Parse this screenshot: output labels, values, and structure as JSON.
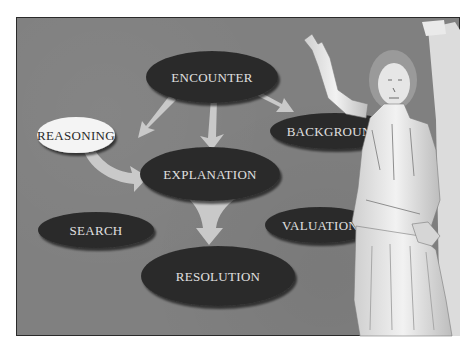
{
  "slide": {
    "background_color": "#808080",
    "frame_border_color": "#2a2a2a"
  },
  "nodes": {
    "encounter": {
      "label": "ENCOUNTER",
      "fill": "#2b2b2b",
      "text_color": "#e0e0e0"
    },
    "reasoning": {
      "label": "REASONING",
      "fill": "#f4f4f4",
      "text_color": "#2a2a2a"
    },
    "background": {
      "label": "BACKGROUND",
      "fill": "#2b2b2b",
      "text_color": "#e0e0e0"
    },
    "explanation": {
      "label": "EXPLANATION",
      "fill": "#2b2b2b",
      "text_color": "#e0e0e0"
    },
    "search": {
      "label": "SEARCH",
      "fill": "#2b2b2b",
      "text_color": "#e0e0e0"
    },
    "valuation": {
      "label": "VALUATION",
      "fill": "#2b2b2b",
      "text_color": "#e0e0e0"
    },
    "resolution": {
      "label": "RESOLUTION",
      "fill": "#2b2b2b",
      "text_color": "#e0e0e0"
    }
  },
  "edges": [
    {
      "from": "ENCOUNTER",
      "to": "REASONING"
    },
    {
      "from": "ENCOUNTER",
      "to": "EXPLANATION"
    },
    {
      "from": "ENCOUNTER",
      "to": "BACKGROUND"
    },
    {
      "from": "REASONING",
      "to": "EXPLANATION"
    },
    {
      "from": "EXPLANATION",
      "to": "RESOLUTION"
    }
  ],
  "image": {
    "subject": "classical-statue-figure"
  }
}
